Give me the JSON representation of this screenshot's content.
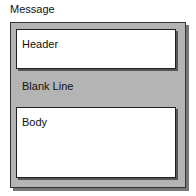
{
  "diagram": {
    "title": "Message",
    "sections": [
      {
        "label": "Header"
      },
      {
        "label": "Blank Line"
      },
      {
        "label": "Body"
      }
    ]
  }
}
